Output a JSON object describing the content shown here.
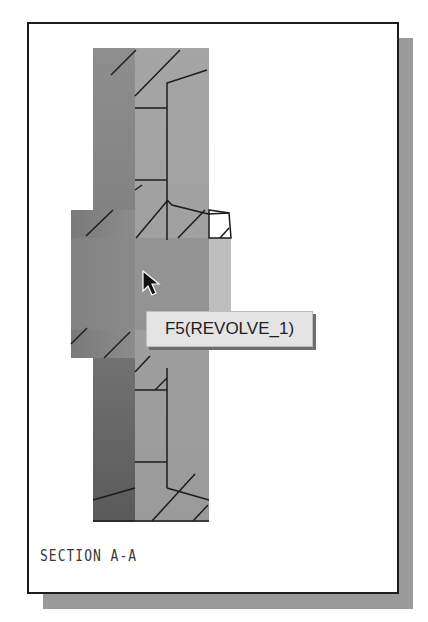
{
  "drawing": {
    "view_label": "SECTION  A-A",
    "tooltip_text": "F5(REVOLVE_1)",
    "colors": {
      "frame_border": "#1c1c1c",
      "shadow": "#9a9a9a",
      "part_light": "#a8a8a8",
      "part_dark": "#6a6a6a",
      "tooltip_bg": "#e4e4e4"
    }
  }
}
